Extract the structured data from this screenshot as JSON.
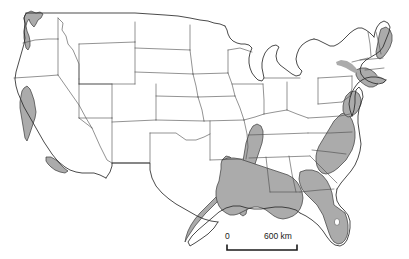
{
  "figure": {
    "kind": "choropleth-map",
    "projection_note": "conterminous-us-outline",
    "background_color": "#ffffff",
    "shaded_fill_color": "#ababab",
    "unshaded_fill_color": "#ffffff",
    "state_border_color": "#4a4a4a",
    "coast_outline_color": "#2b2b2b"
  },
  "scale_bar": {
    "name": "distance-scale",
    "start_label": "0",
    "end_label": "600 km",
    "unit": "km",
    "span_value": 600
  },
  "legend": {
    "shaded_meaning": "shaded region",
    "unshaded_meaning": "unshaded region"
  },
  "shaded_regions": [
    {
      "id": "puget-willamette",
      "label": "Pacific Northwest lowlands"
    },
    {
      "id": "central-valley",
      "label": "California Central Valley"
    },
    {
      "id": "southern-california",
      "label": "Southern California coastal"
    },
    {
      "id": "texas-gulf-coast",
      "label": "Texas Gulf Coast"
    },
    {
      "id": "louisiana-mississippi-embayment",
      "label": "Lower Mississippi Valley"
    },
    {
      "id": "gulf-coastal-plain",
      "label": "Gulf Coastal Plain"
    },
    {
      "id": "florida-peninsula",
      "label": "Florida Peninsula"
    },
    {
      "id": "atlantic-coastal-plain",
      "label": "Atlantic Coastal Plain"
    },
    {
      "id": "chesapeake-delmarva",
      "label": "Chesapeake and Delmarva"
    },
    {
      "id": "northeast-coast",
      "label": "Northeast coastal strip"
    },
    {
      "id": "maine-coast",
      "label": "Maine coastal strip"
    }
  ]
}
